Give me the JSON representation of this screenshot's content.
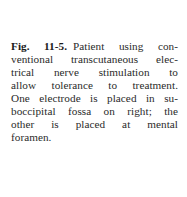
{
  "caption": {
    "label": "Fig. 11-5.",
    "lines": [
      "Patient using con-",
      "ventional transcutaneous elec-",
      "trical nerve stimulation to",
      "allow tolerance to treatment.",
      "One electrode is placed in su-",
      "boccipital fossa on right; the",
      "other is placed at mental",
      "foramen."
    ],
    "full_text": "Patient using conventional transcutaneous electrical nerve stimulation to allow tolerance to treatment. One electrode is placed in suboccipital fossa on right; the other is placed at mental foramen."
  }
}
